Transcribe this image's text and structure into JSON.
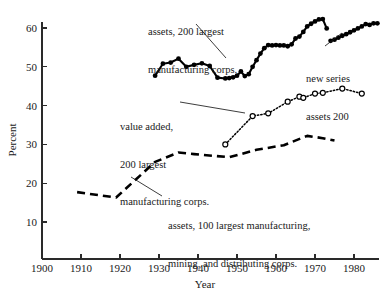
{
  "chart_data": {
    "type": "line",
    "title": "",
    "subtitle": "",
    "xlabel": "Year",
    "ylabel": "Percent",
    "xlim": [
      1900,
      1988
    ],
    "ylim": [
      0,
      64
    ],
    "grid": false,
    "legend_position": "inline-annotations",
    "x_ticks": [
      1900,
      1910,
      1920,
      1930,
      1940,
      1950,
      1960,
      1970,
      1980
    ],
    "y_ticks": [
      10,
      20,
      30,
      40,
      50,
      60
    ],
    "series": [
      {
        "name": "assets, 200 largest manufacturing corps.",
        "style": "solid-filled-circles",
        "x": [
          1929,
          1931,
          1933,
          1935,
          1937,
          1939,
          1941,
          1943,
          1945,
          1947,
          1948,
          1949,
          1950,
          1951,
          1952,
          1953,
          1954,
          1955,
          1956,
          1957,
          1958,
          1959,
          1960,
          1961,
          1962,
          1963,
          1964,
          1965,
          1966,
          1967,
          1968,
          1969,
          1970,
          1971,
          1972,
          1973
        ],
        "y": [
          47.7,
          50.8,
          51.1,
          52.1,
          50.0,
          50.5,
          50.9,
          50.2,
          47.2,
          47.0,
          47.1,
          47.3,
          47.7,
          48.8,
          47.6,
          48.1,
          50.0,
          51.7,
          53.4,
          54.8,
          55.6,
          55.5,
          55.6,
          55.5,
          55.5,
          55.3,
          55.8,
          57.3,
          57.8,
          59.0,
          60.4,
          61.1,
          61.7,
          62.2,
          62.3,
          59.9
        ]
      },
      {
        "name": "new series assets 200",
        "style": "solid-filled-circles",
        "x": [
          1974,
          1975,
          1976,
          1977,
          1978,
          1979,
          1980,
          1981,
          1982,
          1983,
          1984,
          1985,
          1986
        ],
        "y": [
          56.7,
          57.0,
          57.5,
          58.0,
          58.4,
          58.9,
          59.4,
          59.9,
          60.4,
          61.0,
          60.8,
          61.2,
          61.2
        ]
      },
      {
        "name": "value added, 200 largest manufacturing corps.",
        "style": "dotted-open-circles",
        "x": [
          1947,
          1954,
          1958,
          1963,
          1966,
          1967,
          1970,
          1972,
          1977,
          1982
        ],
        "y": [
          30.0,
          37.3,
          38.0,
          41.0,
          42.3,
          42.0,
          43.1,
          43.3,
          44.4,
          43.1
        ]
      },
      {
        "name": "assets, 100 largest manufacturing, mining, and distributing corps.",
        "style": "dashed",
        "x": [
          1909,
          1919,
          1929,
          1935,
          1939,
          1948,
          1955,
          1962,
          1968,
          1972,
          1975
        ],
        "y": [
          17.7,
          16.3,
          25.5,
          27.9,
          27.5,
          26.7,
          28.6,
          29.8,
          32.2,
          31.6,
          31.0
        ]
      }
    ],
    "annotations": [
      {
        "name": "assets-200-label",
        "lines": [
          "assets, 200 largest",
          "manufacturing corps."
        ],
        "leader_from": [
          196,
          24
        ],
        "leader_to": [
          226,
          58
        ]
      },
      {
        "name": "value-added-label",
        "lines": [
          "value added,",
          "200 largest",
          "manufacturing corps."
        ],
        "leader_from": [
          180,
          102
        ],
        "leader_to": [
          245,
          113
        ]
      },
      {
        "name": "assets-100-label",
        "lines": [
          "assets, 100 largest manufacturing,",
          "mining, and distributing corps."
        ],
        "leader_from": [
          162,
          196
        ],
        "leader_to": [
          131,
          177
        ]
      },
      {
        "name": "new-series-label",
        "lines": [
          "new series",
          "assets 200"
        ],
        "leader_from": [
          325,
          46
        ],
        "leader_to": [
          342,
          33
        ]
      }
    ]
  },
  "axis": {
    "y_label": "Percent",
    "x_label": "Year",
    "x_tick_labels": [
      "1900",
      "1910",
      "1920",
      "1930",
      "1940",
      "1950",
      "1960",
      "1970",
      "1980"
    ],
    "y_tick_labels": [
      "10",
      "20",
      "30",
      "40",
      "50",
      "60"
    ]
  },
  "annotations_text": {
    "assets200_line1": "assets, 200 largest",
    "assets200_line2": "manufacturing corps.",
    "valueadded_line1": "value added,",
    "valueadded_line2": "200 largest",
    "valueadded_line3": "manufacturing corps.",
    "assets100_line1": "assets, 100 largest manufacturing,",
    "assets100_line2": "mining, and distributing corps.",
    "newseries_line1": "new series",
    "newseries_line2": "assets 200"
  },
  "colors": {
    "ink": "#000000",
    "background": "#ffffff"
  }
}
